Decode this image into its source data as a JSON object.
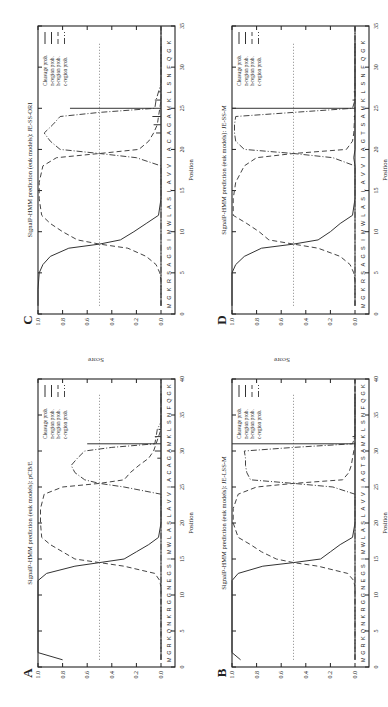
{
  "figure": {
    "shared_ylabel": "Score",
    "legend": [
      "Cleavage prob.",
      "n-region prob.",
      "h-region prob.",
      "c-region prob."
    ]
  },
  "chart_data": [
    {
      "panel": "C",
      "type": "line",
      "title": "SignalP-HMM prediction (euk models): JE-SS-ORI",
      "xlabel": "Position",
      "ylabel": "Score",
      "xlim": [
        0,
        35
      ],
      "ylim": [
        0,
        1.0
      ],
      "xticks": [
        0,
        5,
        10,
        15,
        20,
        25,
        30,
        35
      ],
      "yticks": [
        "0.0",
        "0.2",
        "0.4",
        "0.6",
        "0.8",
        "1.0"
      ],
      "threshold": 0.5,
      "sequence": [
        "M",
        "G",
        "K",
        "R",
        "S",
        "A",
        "G",
        "S",
        "I",
        "M",
        "W",
        "L",
        "A",
        "S",
        "L",
        "A",
        "V",
        "V",
        "I",
        "A",
        "C",
        "A",
        "G",
        "A",
        "M",
        "K",
        "L",
        "S",
        "N",
        "F",
        "Q",
        "G",
        "K"
      ],
      "legend": [
        "Cleavage prob.",
        "n-region prob.",
        "h-region prob.",
        "c-region prob."
      ],
      "series": [
        {
          "name": "n-region prob.",
          "x": [
            1,
            3,
            5,
            6,
            7,
            8,
            8.5,
            9,
            10,
            11,
            12,
            14,
            16,
            18,
            19,
            20,
            35
          ],
          "y": [
            1.0,
            1.0,
            0.99,
            0.96,
            0.9,
            0.75,
            0.5,
            0.33,
            0.22,
            0.12,
            0.02,
            0.0,
            0.0,
            0.0,
            0.0,
            0.0,
            0.0
          ]
        },
        {
          "name": "h-region prob.",
          "x": [
            1,
            4,
            5,
            6,
            7,
            8,
            8.5,
            9,
            10,
            11,
            12,
            14,
            16,
            18,
            19,
            19.5,
            20,
            21,
            22,
            23,
            24,
            25,
            26,
            35
          ],
          "y": [
            0.0,
            0.0,
            0.01,
            0.04,
            0.12,
            0.27,
            0.5,
            0.68,
            0.8,
            0.9,
            0.97,
            0.99,
            0.99,
            0.96,
            0.85,
            0.5,
            0.18,
            0.1,
            0.06,
            0.03,
            0.02,
            0.01,
            0.0,
            0.0
          ]
        },
        {
          "name": "c-region prob.",
          "x": [
            1,
            18,
            19,
            19.5,
            20,
            21,
            22,
            23,
            24,
            24.5,
            25,
            26,
            27,
            28,
            35
          ],
          "y": [
            0.0,
            0.0,
            0.2,
            0.5,
            0.82,
            0.9,
            0.95,
            0.88,
            0.82,
            0.5,
            0.05,
            0.04,
            0.02,
            0.0,
            0.0
          ]
        },
        {
          "name": "Cleavage prob.",
          "x": [
            22,
            23,
            24,
            25,
            26,
            27
          ],
          "y": [
            0.04,
            0.06,
            0.07,
            0.74,
            0.05,
            0.02
          ]
        }
      ]
    },
    {
      "panel": "D",
      "type": "line",
      "title": "SignalP-HMM prediction (euk models): JE-SS-M",
      "xlabel": "Position",
      "ylabel": "Score",
      "xlim": [
        0,
        35
      ],
      "ylim": [
        0,
        1.0
      ],
      "xticks": [
        0,
        5,
        10,
        15,
        20,
        25,
        30,
        35
      ],
      "yticks": [
        "0.0",
        "0.2",
        "0.4",
        "0.6",
        "0.8",
        "1.0"
      ],
      "threshold": 0.5,
      "sequence": [
        "M",
        "G",
        "K",
        "R",
        "S",
        "A",
        "G",
        "S",
        "I",
        "M",
        "W",
        "L",
        "A",
        "S",
        "L",
        "A",
        "V",
        "V",
        "I",
        "A",
        "G",
        "T",
        "S",
        "A",
        "M",
        "K",
        "L",
        "S",
        "N",
        "F",
        "Q",
        "G",
        "K"
      ],
      "legend": [
        "Cleavage prob.",
        "n-region prob.",
        "h-region prob.",
        "c-region prob."
      ],
      "series": [
        {
          "name": "n-region prob.",
          "x": [
            1,
            5,
            6,
            7,
            8,
            8.5,
            9,
            10,
            11,
            12,
            14,
            16,
            18,
            19,
            20,
            35
          ],
          "y": [
            1.0,
            1.0,
            0.97,
            0.9,
            0.76,
            0.5,
            0.3,
            0.2,
            0.12,
            0.02,
            0.0,
            0.0,
            0.0,
            0.01,
            0.0,
            0.0
          ]
        },
        {
          "name": "h-region prob.",
          "x": [
            1,
            4,
            5,
            6,
            7,
            8,
            8.5,
            9,
            10,
            11,
            12,
            14,
            16,
            18,
            19,
            19.5,
            20,
            21,
            22,
            25,
            35
          ],
          "y": [
            0.0,
            0.0,
            0.01,
            0.04,
            0.12,
            0.3,
            0.5,
            0.7,
            0.78,
            0.88,
            0.99,
            0.99,
            0.97,
            0.9,
            0.8,
            0.5,
            0.07,
            0.02,
            0.01,
            0.0,
            0.0
          ]
        },
        {
          "name": "c-region prob.",
          "x": [
            1,
            18,
            19,
            19.5,
            20,
            21,
            22,
            23,
            24,
            24.5,
            25,
            26,
            35
          ],
          "y": [
            0.0,
            0.0,
            0.18,
            0.5,
            0.9,
            0.97,
            0.98,
            0.98,
            0.97,
            0.5,
            0.02,
            0.0,
            0.0
          ]
        },
        {
          "name": "Cleavage prob.",
          "x": [
            23,
            24,
            25,
            26,
            27
          ],
          "y": [
            0.0,
            0.01,
            1.0,
            0.02,
            0.01
          ]
        }
      ]
    },
    {
      "panel": "A",
      "type": "line",
      "title": "SignalP-HMM prediction (euk models): pCB/E",
      "xlabel": "Position",
      "ylabel": "Score",
      "xlim": [
        0,
        40
      ],
      "ylim": [
        0,
        1.0
      ],
      "xticks": [
        0,
        5,
        10,
        15,
        20,
        25,
        30,
        35,
        40
      ],
      "yticks": [
        "0.0",
        "0.2",
        "0.4",
        "0.6",
        "0.8",
        "1.0"
      ],
      "threshold": 0.5,
      "sequence": [
        "M",
        "G",
        "R",
        "K",
        "Q",
        "N",
        "K",
        "R",
        "G",
        "G",
        "N",
        "E",
        "G",
        "S",
        "I",
        "M",
        "W",
        "L",
        "A",
        "S",
        "L",
        "A",
        "V",
        "V",
        "I",
        "A",
        "C",
        "A",
        "G",
        "A",
        "M",
        "K",
        "L",
        "S",
        "N",
        "F",
        "Q",
        "G",
        "K"
      ],
      "legend": [
        "Cleavage prob.",
        "n-region prob.",
        "h-region prob.",
        "c-region prob."
      ],
      "series": [
        {
          "name": "n-region prob.",
          "x": [
            1,
            2,
            12,
            13,
            14,
            14.5,
            15,
            16,
            17,
            18,
            20,
            22,
            24,
            25,
            26,
            40
          ],
          "y": [
            0.8,
            1.0,
            1.0,
            0.93,
            0.7,
            0.5,
            0.3,
            0.2,
            0.1,
            0.02,
            0.0,
            0.0,
            0.0,
            0.0,
            0.0,
            0.0
          ]
        },
        {
          "name": "h-region prob.",
          "x": [
            1,
            11,
            12,
            13,
            14,
            14.5,
            15,
            16,
            17,
            18,
            20,
            22,
            24,
            25,
            25.5,
            26,
            27,
            28,
            29,
            30,
            31,
            33,
            40
          ],
          "y": [
            0.0,
            0.0,
            0.01,
            0.05,
            0.3,
            0.5,
            0.7,
            0.8,
            0.9,
            0.97,
            0.98,
            0.98,
            0.95,
            0.8,
            0.5,
            0.3,
            0.25,
            0.18,
            0.1,
            0.06,
            0.04,
            0.0,
            0.0
          ]
        },
        {
          "name": "c-region prob.",
          "x": [
            1,
            24,
            25,
            25.5,
            26,
            27,
            28,
            29,
            30,
            30.5,
            31,
            32,
            33,
            34,
            40
          ],
          "y": [
            0.0,
            0.0,
            0.3,
            0.5,
            0.62,
            0.7,
            0.73,
            0.68,
            0.62,
            0.4,
            0.05,
            0.04,
            0.03,
            0.0,
            0.0
          ]
        },
        {
          "name": "Cleavage prob.",
          "x": [
            28,
            29,
            30,
            31,
            32,
            33
          ],
          "y": [
            0.0,
            0.03,
            0.05,
            0.6,
            0.05,
            0.02
          ]
        }
      ]
    },
    {
      "panel": "B",
      "type": "line",
      "title": "SignalP-HMM prediction (euk models): JE-LSS-M",
      "xlabel": "Position",
      "ylabel": "Score",
      "xlim": [
        0,
        40
      ],
      "ylim": [
        0,
        1.0
      ],
      "xticks": [
        0,
        5,
        10,
        15,
        20,
        25,
        30,
        35,
        40
      ],
      "yticks": [
        "0.0",
        "0.2",
        "0.4",
        "0.6",
        "0.8",
        "1.0"
      ],
      "threshold": 0.5,
      "sequence": [
        "M",
        "G",
        "R",
        "K",
        "Q",
        "N",
        "K",
        "R",
        "G",
        "G",
        "N",
        "E",
        "G",
        "S",
        "I",
        "M",
        "W",
        "L",
        "A",
        "S",
        "L",
        "A",
        "V",
        "V",
        "I",
        "A",
        "G",
        "T",
        "S",
        "A",
        "M",
        "K",
        "L",
        "S",
        "N",
        "F",
        "Q",
        "G",
        "K"
      ],
      "legend": [
        "Cleavage prob.",
        "n-region prob.",
        "h-region prob.",
        "c-region prob."
      ],
      "series": [
        {
          "name": "n-region prob.",
          "x": [
            1,
            2,
            12,
            13,
            14,
            14.5,
            15,
            16,
            17,
            18,
            20,
            22,
            24,
            25,
            40
          ],
          "y": [
            0.93,
            1.0,
            1.0,
            0.95,
            0.75,
            0.5,
            0.28,
            0.2,
            0.12,
            0.02,
            0.0,
            0.0,
            0.0,
            0.0,
            0.0
          ]
        },
        {
          "name": "h-region prob.",
          "x": [
            1,
            11,
            12,
            13,
            14,
            14.5,
            15,
            16,
            17,
            18,
            20,
            22,
            24,
            25,
            25.5,
            26,
            27,
            28,
            29,
            30,
            31,
            40
          ],
          "y": [
            0.0,
            0.0,
            0.01,
            0.06,
            0.3,
            0.5,
            0.64,
            0.76,
            0.85,
            0.95,
            0.99,
            0.99,
            0.95,
            0.8,
            0.5,
            0.1,
            0.05,
            0.03,
            0.02,
            0.01,
            0.0,
            0.0
          ]
        },
        {
          "name": "c-region prob.",
          "x": [
            1,
            24,
            25,
            25.5,
            26,
            27,
            28,
            29,
            30,
            30.5,
            31,
            32,
            40
          ],
          "y": [
            0.0,
            0.0,
            0.18,
            0.5,
            0.85,
            0.88,
            0.89,
            0.89,
            0.9,
            0.5,
            0.02,
            0.0,
            0.0
          ]
        },
        {
          "name": "Cleavage prob.",
          "x": [
            29,
            30,
            31,
            32,
            33
          ],
          "y": [
            0.0,
            0.0,
            1.0,
            0.02,
            0.0
          ]
        }
      ]
    }
  ]
}
